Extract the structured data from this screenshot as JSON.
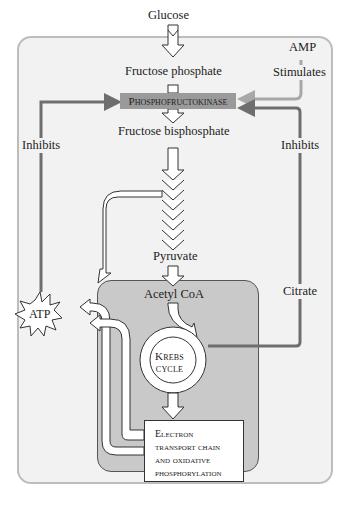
{
  "diagram": {
    "nodes": {
      "glucose": "Glucose",
      "fructose_phosphate": "Fructose phosphate",
      "phosphofructokinase": "Phosphofructokinase",
      "fructose_bisphosphate": "Fructose bisphosphate",
      "pyruvate": "Pyruvate",
      "acetyl_coa": "Acetyl CoA",
      "krebs_line1": "Krebs",
      "krebs_line2": "cycle",
      "etc_line1": "Electron",
      "etc_line2": "transport chain",
      "etc_line3": "and oxidative",
      "etc_line4": "phosphorylation",
      "atp": "ATP",
      "amp": "AMP",
      "citrate": "Citrate"
    },
    "edge_labels": {
      "stimulates": "Stimulates",
      "inhibits_left": "Inhibits",
      "inhibits_right": "Inhibits"
    },
    "colors": {
      "outer_bg": "#f2f2f2",
      "outer_border": "#bdbdbd",
      "mito_bg": "#c9c9c9",
      "pfk_bg": "#9a9a9a",
      "inhibit_line": "#6e6e6e",
      "stimulate_line": "#a8a8a8"
    }
  }
}
